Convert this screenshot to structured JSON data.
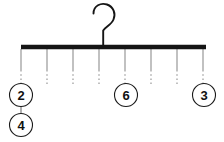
{
  "diagram": {
    "type": "hanger-mobile",
    "title": "",
    "background_color": "#ffffff",
    "bar": {
      "name": "horizontal-bar",
      "color": "#151515",
      "x1": 21,
      "x2": 206,
      "y": 47,
      "thickness": 4.5
    },
    "hook": {
      "name": "hanger-hook",
      "color": "#151515",
      "shape": "question-mark",
      "stroke_width": 1.9,
      "top_y": 4,
      "stem_x": 103,
      "stem_bottom_y": 46
    },
    "string_style": {
      "solid_color": "#8e8e8e",
      "dotted_color": "#8e8e8e",
      "solid_top_y": 49,
      "solid_bottom_y": 70,
      "dotted_bottom_y": 84,
      "stroke_width": 1.1,
      "dash_pattern": "1.6 2.6"
    },
    "strings": [
      {
        "name": "string-1",
        "x": 21,
        "has_node": true,
        "node_value": "2"
      },
      {
        "name": "string-2",
        "x": 47,
        "has_node": false,
        "node_value": ""
      },
      {
        "name": "string-3",
        "x": 73,
        "has_node": false,
        "node_value": ""
      },
      {
        "name": "string-4",
        "x": 99,
        "has_node": false,
        "node_value": ""
      },
      {
        "name": "string-5",
        "x": 125,
        "has_node": true,
        "node_value": "6"
      },
      {
        "name": "string-6",
        "x": 151,
        "has_node": false,
        "node_value": ""
      },
      {
        "name": "string-7",
        "x": 177,
        "has_node": false,
        "node_value": ""
      },
      {
        "name": "string-8",
        "x": 203,
        "has_node": true,
        "node_value": "3"
      }
    ],
    "nodes": [
      {
        "name": "node-circle-2",
        "label": "2",
        "cx": 21,
        "cy": 95,
        "r": 11.5,
        "fill": "#ffffff",
        "stroke": "#1a1a1a",
        "stroke_width": 1.1
      },
      {
        "name": "node-circle-4",
        "label": "4",
        "cx": 21,
        "cy": 125,
        "r": 11.5,
        "fill": "#ffffff",
        "stroke": "#1a1a1a",
        "stroke_width": 1.1
      },
      {
        "name": "node-circle-6",
        "label": "6",
        "cx": 126,
        "cy": 95,
        "r": 11.5,
        "fill": "#ffffff",
        "stroke": "#1a1a1a",
        "stroke_width": 1.1
      },
      {
        "name": "node-circle-3",
        "label": "3",
        "cx": 204,
        "cy": 95,
        "r": 11.5,
        "fill": "#ffffff",
        "stroke": "#1a1a1a",
        "stroke_width": 1.1
      }
    ],
    "connectors": [
      {
        "name": "connector-2-to-4",
        "x": 21,
        "y1": 106,
        "y2": 114,
        "color": "#6f6f6f",
        "stroke_width": 1.1
      }
    ]
  }
}
